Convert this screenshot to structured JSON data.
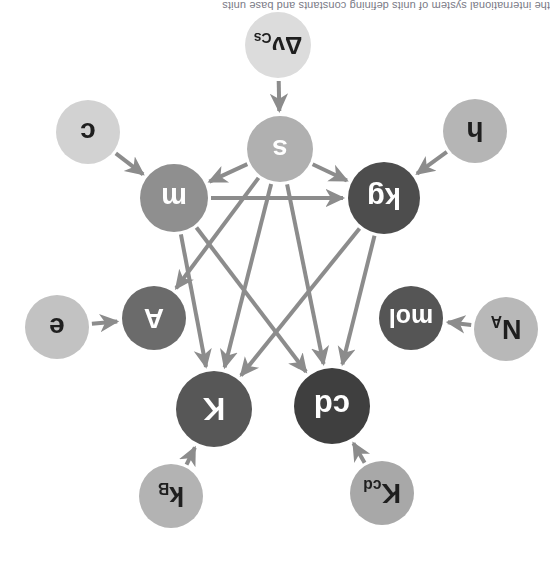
{
  "figure": {
    "orientation": "rotated-180",
    "background_color": "#ffffff",
    "width": 554,
    "height": 561,
    "edge_color": "#8c8c8c",
    "caption_partial": "the international system of units defining constants and base units"
  },
  "nodes": [
    {
      "id": "K_cd",
      "label": "K",
      "sub": "cd",
      "kind": "defining-constant",
      "cx": 172,
      "cy": 68,
      "r": 32,
      "fill": "#a8a8a8",
      "text_color": "#1f1f1f",
      "font_size": 27
    },
    {
      "id": "k_B",
      "label": "k",
      "sub": "B",
      "kind": "defining-constant",
      "cx": 383,
      "cy": 65,
      "r": 32,
      "fill": "#b3b3b3",
      "text_color": "#1f1f1f",
      "font_size": 27
    },
    {
      "id": "cd",
      "label": "cd",
      "sub": "",
      "kind": "base-unit",
      "cx": 222,
      "cy": 155,
      "r": 38,
      "fill": "#3f3f3f",
      "text_color": "#ffffff",
      "font_size": 31
    },
    {
      "id": "K",
      "label": "K",
      "sub": "",
      "kind": "base-unit",
      "cx": 340,
      "cy": 152,
      "r": 38,
      "fill": "#575757",
      "text_color": "#ffffff",
      "font_size": 31
    },
    {
      "id": "N_A",
      "label": "N",
      "sub": "A",
      "kind": "defining-constant",
      "cx": 48,
      "cy": 232,
      "r": 32,
      "fill": "#b8b8b8",
      "text_color": "#1f1f1f",
      "font_size": 27
    },
    {
      "id": "mol",
      "label": "mol",
      "sub": "",
      "kind": "base-unit",
      "cx": 143,
      "cy": 243,
      "r": 32,
      "fill": "#555555",
      "text_color": "#ffffff",
      "font_size": 25
    },
    {
      "id": "A_unit",
      "label": "A",
      "sub": "",
      "kind": "base-unit",
      "cx": 400,
      "cy": 243,
      "r": 32,
      "fill": "#6b6b6b",
      "text_color": "#ffffff",
      "font_size": 28
    },
    {
      "id": "e",
      "label": "e",
      "sub": "",
      "kind": "defining-constant",
      "cx": 497,
      "cy": 234,
      "r": 32,
      "fill": "#c2c2c2",
      "text_color": "#1f1f1f",
      "font_size": 28
    },
    {
      "id": "kg",
      "label": "kg",
      "sub": "",
      "kind": "base-unit",
      "cx": 170,
      "cy": 363,
      "r": 36,
      "fill": "#4d4d4d",
      "text_color": "#ffffff",
      "font_size": 29
    },
    {
      "id": "m",
      "label": "m",
      "sub": "",
      "kind": "base-unit",
      "cx": 380,
      "cy": 363,
      "r": 34,
      "fill": "#8f8f8f",
      "text_color": "#ffffff",
      "font_size": 29
    },
    {
      "id": "h",
      "label": "h",
      "sub": "",
      "kind": "defining-constant",
      "cx": 79,
      "cy": 430,
      "r": 32,
      "fill": "#b5b5b5",
      "text_color": "#1f1f1f",
      "font_size": 28
    },
    {
      "id": "s",
      "label": "s",
      "sub": "",
      "kind": "base-unit",
      "cx": 274,
      "cy": 412,
      "r": 33,
      "fill": "#b0b0b0",
      "text_color": "#ffffff",
      "font_size": 28
    },
    {
      "id": "c",
      "label": "c",
      "sub": "",
      "kind": "defining-constant",
      "cx": 466,
      "cy": 429,
      "r": 32,
      "fill": "#d2d2d2",
      "text_color": "#1f1f1f",
      "font_size": 28
    },
    {
      "id": "dv_Cs",
      "label": "Δν",
      "sub": "Cs",
      "kind": "defining-constant",
      "cx": 276,
      "cy": 516,
      "r": 33,
      "fill": "#dcdcdc",
      "text_color": "#1f1f1f",
      "font_size": 24
    }
  ],
  "edges": [
    {
      "from": "K_cd",
      "to": "cd",
      "label": ""
    },
    {
      "from": "k_B",
      "to": "K",
      "label": ""
    },
    {
      "from": "N_A",
      "to": "mol",
      "label": ""
    },
    {
      "from": "e",
      "to": "A_unit",
      "label": ""
    },
    {
      "from": "h",
      "to": "kg",
      "label": ""
    },
    {
      "from": "c",
      "to": "m",
      "label": ""
    },
    {
      "from": "dv_Cs",
      "to": "s",
      "label": ""
    },
    {
      "from": "kg",
      "to": "cd",
      "label": ""
    },
    {
      "from": "kg",
      "to": "K",
      "label": ""
    },
    {
      "from": "m",
      "to": "cd",
      "label": ""
    },
    {
      "from": "m",
      "to": "K",
      "label": ""
    },
    {
      "from": "m",
      "to": "kg",
      "label": ""
    },
    {
      "from": "s",
      "to": "cd",
      "label": ""
    },
    {
      "from": "s",
      "to": "K",
      "label": ""
    },
    {
      "from": "s",
      "to": "kg",
      "label": ""
    },
    {
      "from": "s",
      "to": "m",
      "label": ""
    },
    {
      "from": "s",
      "to": "A_unit",
      "label": ""
    }
  ]
}
